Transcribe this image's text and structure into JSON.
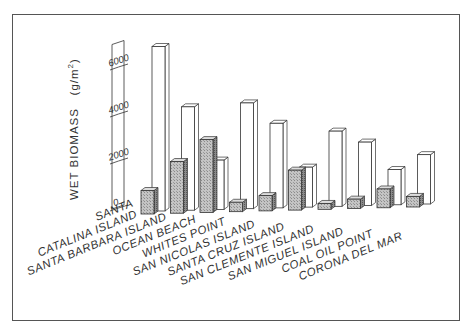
{
  "chart_data": {
    "type": "bar",
    "style": "3d-perspective",
    "title": "",
    "xlabel": "",
    "ylabel": "WET BIOMASS (g/m²)",
    "ylabel_main": "WET BIOMASS",
    "ylabel_unit": "(g/m",
    "ylabel_unit_sup": "2",
    "ylabel_unit_close": ")",
    "yticks": [
      "0",
      "2000",
      "4000",
      "6000"
    ],
    "ylim": [
      0,
      7000
    ],
    "grid": false,
    "legend": null,
    "categories": [
      "SANTA CATALINA ISLAND",
      "SANTA BARBARA ISLAND",
      "OCEAN BEACH",
      "WHITES POINT",
      "SAN NICOLAS ISLAND",
      "SANTA CRUZ ISLAND",
      "SAN CLEMENTE ISLAND",
      "SAN MIGUEL ISLAND",
      "COAL OIL POINT",
      "CORONA DEL MAR"
    ],
    "category_lines": [
      [
        "SANTA",
        "CATALINA ISLAND"
      ],
      [
        "SANTA BARBARA ISLAND"
      ],
      [
        "OCEAN BEACH"
      ],
      [
        "WHITES POINT"
      ],
      [
        "SAN NICOLAS ISLAND"
      ],
      [
        "SANTA CRUZ ISLAND"
      ],
      [
        "SAN CLEMENTE ISLAND"
      ],
      [
        "SAN MIGUEL ISLAND"
      ],
      [
        "COAL OIL POINT"
      ],
      [
        "CORONA DEL MAR"
      ]
    ],
    "series": [
      {
        "name": "shaded (front)",
        "fill": "#b8b8b8",
        "values": [
          1000,
          2200,
          3100,
          400,
          650,
          1700,
          250,
          400,
          800,
          450
        ]
      },
      {
        "name": "open (back)",
        "fill": "#ffffff",
        "values": [
          7000,
          4400,
          2100,
          4500,
          3600,
          1700,
          3200,
          2700,
          1500,
          2100
        ]
      }
    ]
  },
  "colors": {
    "frame": "#555555",
    "ink": "#333333",
    "shade": "#b8b8b8",
    "shade_dark": "#7a7a7a",
    "open": "#ffffff"
  }
}
